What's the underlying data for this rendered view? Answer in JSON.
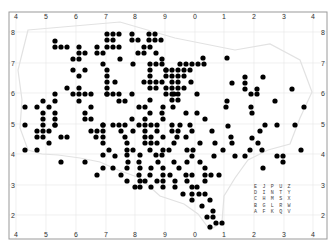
{
  "map": {
    "frame": {
      "x": 9,
      "y": 12,
      "w": 318,
      "h": 227,
      "border": "#9a9a9a"
    },
    "top_ticks": [
      {
        "label": "4",
        "x": 16
      },
      {
        "label": "5",
        "x": 46
      },
      {
        "label": "6",
        "x": 76
      },
      {
        "label": "7",
        "x": 106
      },
      {
        "label": "8",
        "x": 135
      },
      {
        "label": "9",
        "x": 165
      },
      {
        "label": "0",
        "x": 195
      },
      {
        "label": "1",
        "x": 224
      },
      {
        "label": "2",
        "x": 254
      },
      {
        "label": "3",
        "x": 284
      },
      {
        "label": "4",
        "x": 313
      }
    ],
    "bottom_ticks": [
      {
        "label": "4",
        "x": 16
      },
      {
        "label": "5",
        "x": 46
      },
      {
        "label": "6",
        "x": 76
      },
      {
        "label": "7",
        "x": 106
      },
      {
        "label": "8",
        "x": 135
      },
      {
        "label": "9",
        "x": 165
      },
      {
        "label": "0",
        "x": 195
      },
      {
        "label": "1",
        "x": 224
      },
      {
        "label": "2",
        "x": 254
      },
      {
        "label": "3",
        "x": 284
      },
      {
        "label": "4",
        "x": 313
      }
    ],
    "left_ticks": [
      {
        "label": "8",
        "y": 32
      },
      {
        "label": "7",
        "y": 63
      },
      {
        "label": "6",
        "y": 93
      },
      {
        "label": "5",
        "y": 124
      },
      {
        "label": "4",
        "y": 154
      },
      {
        "label": "3",
        "y": 185
      },
      {
        "label": "2",
        "y": 215
      }
    ],
    "right_ticks": [
      {
        "label": "8",
        "y": 32
      },
      {
        "label": "7",
        "y": 63
      },
      {
        "label": "6",
        "y": 93
      },
      {
        "label": "5",
        "y": 124
      },
      {
        "label": "4",
        "y": 154
      },
      {
        "label": "3",
        "y": 185
      },
      {
        "label": "2",
        "y": 215
      }
    ],
    "dot_color": "#000000",
    "dot_radius": 2.6,
    "dots": [
      [
        107,
        34
      ],
      [
        113,
        34
      ],
      [
        119,
        34
      ],
      [
        132,
        34
      ],
      [
        149,
        34
      ],
      [
        155,
        34
      ],
      [
        107,
        40
      ],
      [
        113,
        40
      ],
      [
        132,
        40
      ],
      [
        138,
        40
      ],
      [
        149,
        40
      ],
      [
        155,
        40
      ],
      [
        161,
        40
      ],
      [
        55,
        41
      ],
      [
        55,
        47
      ],
      [
        61,
        47
      ],
      [
        67,
        47
      ],
      [
        79,
        47
      ],
      [
        97,
        47
      ],
      [
        107,
        47
      ],
      [
        113,
        47
      ],
      [
        119,
        47
      ],
      [
        144,
        47
      ],
      [
        150,
        47
      ],
      [
        79,
        53
      ],
      [
        85,
        53
      ],
      [
        97,
        53
      ],
      [
        103,
        53
      ],
      [
        138,
        53
      ],
      [
        144,
        53
      ],
      [
        156,
        53
      ],
      [
        73,
        59
      ],
      [
        79,
        59
      ],
      [
        120,
        59
      ],
      [
        162,
        59
      ],
      [
        227,
        58
      ],
      [
        103,
        64
      ],
      [
        133,
        64
      ],
      [
        150,
        64
      ],
      [
        156,
        64
      ],
      [
        162,
        64
      ],
      [
        180,
        64
      ],
      [
        186,
        64
      ],
      [
        192,
        64
      ],
      [
        198,
        64
      ],
      [
        204,
        64
      ],
      [
        203,
        58
      ],
      [
        107,
        70
      ],
      [
        150,
        70
      ],
      [
        166,
        70
      ],
      [
        172,
        70
      ],
      [
        178,
        70
      ],
      [
        184,
        70
      ],
      [
        190,
        70
      ],
      [
        73,
        70
      ],
      [
        85,
        70
      ],
      [
        107,
        76
      ],
      [
        150,
        76
      ],
      [
        166,
        70
      ],
      [
        166,
        76
      ],
      [
        172,
        76
      ],
      [
        178,
        76
      ],
      [
        184,
        76
      ],
      [
        245,
        77
      ],
      [
        263,
        77
      ],
      [
        79,
        76
      ],
      [
        107,
        82
      ],
      [
        115,
        82
      ],
      [
        144,
        82
      ],
      [
        150,
        82
      ],
      [
        156,
        82
      ],
      [
        162,
        82
      ],
      [
        172,
        82
      ],
      [
        178,
        82
      ],
      [
        191,
        82
      ],
      [
        232,
        83
      ],
      [
        245,
        83
      ],
      [
        67,
        88
      ],
      [
        79,
        88
      ],
      [
        107,
        88
      ],
      [
        150,
        88
      ],
      [
        156,
        88
      ],
      [
        166,
        88
      ],
      [
        172,
        88
      ],
      [
        178,
        88
      ],
      [
        184,
        88
      ],
      [
        245,
        89
      ],
      [
        257,
        89
      ],
      [
        292,
        89
      ],
      [
        73,
        94
      ],
      [
        85,
        94
      ],
      [
        107,
        94
      ],
      [
        166,
        94
      ],
      [
        172,
        94
      ],
      [
        178,
        94
      ],
      [
        251,
        94
      ],
      [
        257,
        94
      ],
      [
        55,
        94
      ],
      [
        79,
        94
      ],
      [
        91,
        94
      ],
      [
        107,
        94
      ],
      [
        113,
        94
      ],
      [
        119,
        94
      ],
      [
        132,
        94
      ],
      [
        174,
        94
      ],
      [
        197,
        94
      ],
      [
        43,
        101
      ],
      [
        55,
        101
      ],
      [
        79,
        101
      ],
      [
        119,
        101
      ],
      [
        125,
        101
      ],
      [
        150,
        100
      ],
      [
        172,
        100
      ],
      [
        178,
        100
      ],
      [
        227,
        101
      ],
      [
        275,
        101
      ],
      [
        25,
        107
      ],
      [
        37,
        107
      ],
      [
        49,
        107
      ],
      [
        91,
        107
      ],
      [
        139,
        107
      ],
      [
        145,
        107
      ],
      [
        163,
        107
      ],
      [
        173,
        107
      ],
      [
        226,
        107
      ],
      [
        251,
        107
      ],
      [
        304,
        107
      ],
      [
        43,
        113
      ],
      [
        55,
        113
      ],
      [
        85,
        113
      ],
      [
        150,
        113
      ],
      [
        162,
        113
      ],
      [
        186,
        113
      ],
      [
        197,
        113
      ],
      [
        252,
        113
      ],
      [
        55,
        119
      ],
      [
        55,
        125
      ],
      [
        43,
        119
      ],
      [
        55,
        125
      ],
      [
        85,
        119
      ],
      [
        103,
        125
      ],
      [
        113,
        125
      ],
      [
        119,
        125
      ],
      [
        125,
        125
      ],
      [
        132,
        119
      ],
      [
        145,
        119
      ],
      [
        163,
        119
      ],
      [
        205,
        119
      ],
      [
        25,
        125
      ],
      [
        43,
        125
      ],
      [
        91,
        119
      ],
      [
        103,
        125
      ],
      [
        139,
        125
      ],
      [
        145,
        125
      ],
      [
        151,
        125
      ],
      [
        157,
        125
      ],
      [
        172,
        125
      ],
      [
        180,
        125
      ],
      [
        190,
        125
      ],
      [
        228,
        126
      ],
      [
        265,
        125
      ],
      [
        277,
        125
      ],
      [
        295,
        125
      ],
      [
        37,
        131
      ],
      [
        43,
        131
      ],
      [
        49,
        131
      ],
      [
        91,
        131
      ],
      [
        97,
        131
      ],
      [
        103,
        131
      ],
      [
        121,
        131
      ],
      [
        133,
        131
      ],
      [
        145,
        131
      ],
      [
        157,
        131
      ],
      [
        172,
        131
      ],
      [
        178,
        131
      ],
      [
        192,
        131
      ],
      [
        212,
        131
      ],
      [
        260,
        131
      ],
      [
        37,
        137
      ],
      [
        43,
        137
      ],
      [
        61,
        137
      ],
      [
        67,
        137
      ],
      [
        96,
        137
      ],
      [
        103,
        137
      ],
      [
        125,
        137
      ],
      [
        145,
        137
      ],
      [
        151,
        137
      ],
      [
        163,
        137
      ],
      [
        177,
        137
      ],
      [
        186,
        137
      ],
      [
        231,
        137
      ],
      [
        49,
        143
      ],
      [
        103,
        143
      ],
      [
        127,
        143
      ],
      [
        145,
        143
      ],
      [
        151,
        143
      ],
      [
        157,
        143
      ],
      [
        174,
        143
      ],
      [
        200,
        143
      ],
      [
        215,
        143
      ],
      [
        232,
        143
      ],
      [
        252,
        138
      ],
      [
        258,
        143
      ],
      [
        25,
        150
      ],
      [
        37,
        150
      ],
      [
        109,
        150
      ],
      [
        127,
        150
      ],
      [
        133,
        150
      ],
      [
        150,
        150
      ],
      [
        163,
        150
      ],
      [
        169,
        150
      ],
      [
        187,
        150
      ],
      [
        193,
        150
      ],
      [
        223,
        150
      ],
      [
        250,
        150
      ],
      [
        262,
        150
      ],
      [
        301,
        150
      ],
      [
        103,
        155
      ],
      [
        127,
        155
      ],
      [
        140,
        155
      ],
      [
        156,
        155
      ],
      [
        162,
        155
      ],
      [
        192,
        156
      ],
      [
        214,
        156
      ],
      [
        235,
        156
      ],
      [
        245,
        156
      ],
      [
        277,
        156
      ],
      [
        283,
        156
      ],
      [
        61,
        162
      ],
      [
        85,
        162
      ],
      [
        115,
        156
      ],
      [
        128,
        162
      ],
      [
        139,
        162
      ],
      [
        158,
        162
      ],
      [
        174,
        162
      ],
      [
        187,
        162
      ],
      [
        200,
        162
      ],
      [
        283,
        162
      ],
      [
        103,
        168
      ],
      [
        113,
        168
      ],
      [
        127,
        168
      ],
      [
        140,
        168
      ],
      [
        151,
        168
      ],
      [
        163,
        168
      ],
      [
        179,
        168
      ],
      [
        205,
        168
      ],
      [
        263,
        168
      ],
      [
        97,
        175
      ],
      [
        121,
        175
      ],
      [
        139,
        175
      ],
      [
        150,
        175
      ],
      [
        163,
        175
      ],
      [
        170,
        175
      ],
      [
        186,
        175
      ],
      [
        192,
        175
      ],
      [
        205,
        175
      ],
      [
        211,
        175
      ],
      [
        219,
        175
      ],
      [
        127,
        181
      ],
      [
        140,
        181
      ],
      [
        145,
        181
      ],
      [
        157,
        181
      ],
      [
        163,
        181
      ],
      [
        175,
        181
      ],
      [
        187,
        181
      ],
      [
        205,
        181
      ],
      [
        135,
        187
      ],
      [
        140,
        187
      ],
      [
        151,
        187
      ],
      [
        163,
        187
      ],
      [
        175,
        187
      ],
      [
        192,
        187
      ],
      [
        197,
        187
      ],
      [
        183,
        194
      ],
      [
        192,
        194
      ],
      [
        199,
        194
      ],
      [
        205,
        194
      ],
      [
        192,
        200
      ],
      [
        210,
        200
      ],
      [
        202,
        206
      ],
      [
        213,
        211
      ],
      [
        207,
        217
      ],
      [
        213,
        217
      ],
      [
        216,
        223
      ],
      [
        222,
        223
      ],
      [
        210,
        227
      ]
    ],
    "legend_grid": {
      "x": 254,
      "y": 188,
      "rows": [
        "E J P U Z",
        "D I N T Y",
        "C H M S X",
        "B G L R W",
        "A F K Q V"
      ]
    },
    "boundary_color": "#dcdcdc",
    "grid_color": "#e6e6e6"
  }
}
